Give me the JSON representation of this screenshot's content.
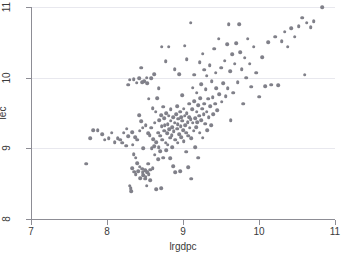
{
  "chart_data": {
    "type": "scatter",
    "title": "",
    "xlabel": "lrgdpc",
    "ylabel": "lec",
    "xlim": [
      7,
      11
    ],
    "ylim": [
      8,
      11
    ],
    "xticks": [
      7,
      8,
      9,
      10,
      11
    ],
    "yticks": [
      8,
      9,
      10,
      11
    ],
    "xticklabels": [
      "7",
      "8",
      "9",
      "10",
      "11"
    ],
    "yticklabels": [
      "8",
      "9",
      "10",
      "11"
    ],
    "grid": "horizontal",
    "legend": "none",
    "marker_color": "#808089",
    "marker_size": 3.6,
    "n_points": 243,
    "points": [
      [
        7.73,
        8.78
      ],
      [
        7.78,
        9.14
      ],
      [
        7.82,
        9.26
      ],
      [
        7.88,
        9.26
      ],
      [
        7.94,
        9.2
      ],
      [
        7.97,
        9.12
      ],
      [
        8.02,
        9.14
      ],
      [
        8.06,
        9.22
      ],
      [
        8.1,
        9.09
      ],
      [
        8.14,
        9.14
      ],
      [
        8.17,
        9.12
      ],
      [
        8.2,
        9.08
      ],
      [
        8.22,
        9.22
      ],
      [
        8.25,
        9.04
      ],
      [
        8.26,
        9.28
      ],
      [
        8.28,
        9.17
      ],
      [
        8.28,
        9.9
      ],
      [
        8.3,
        9.97
      ],
      [
        8.3,
        8.47
      ],
      [
        8.31,
        8.44
      ],
      [
        8.32,
        8.39
      ],
      [
        8.33,
        9.23
      ],
      [
        8.33,
        8.72
      ],
      [
        8.34,
        9.05
      ],
      [
        8.35,
        8.92
      ],
      [
        8.35,
        9.98
      ],
      [
        8.36,
        8.67
      ],
      [
        8.37,
        9.16
      ],
      [
        8.38,
        8.87
      ],
      [
        8.38,
        8.63
      ],
      [
        8.39,
        9.93
      ],
      [
        8.4,
        9.12
      ],
      [
        8.4,
        8.79
      ],
      [
        8.41,
        8.68
      ],
      [
        8.42,
        9.47
      ],
      [
        8.42,
        9.99
      ],
      [
        8.43,
        9.25
      ],
      [
        8.43,
        8.74
      ],
      [
        8.44,
        8.58
      ],
      [
        8.45,
        10.14
      ],
      [
        8.45,
        9.38
      ],
      [
        8.46,
        9.94
      ],
      [
        8.46,
        8.71
      ],
      [
        8.47,
        9.29
      ],
      [
        8.47,
        8.66
      ],
      [
        8.48,
        8.62
      ],
      [
        8.48,
        9.0
      ],
      [
        8.49,
        9.95
      ],
      [
        8.5,
        8.69
      ],
      [
        8.5,
        8.57
      ],
      [
        8.51,
        8.6
      ],
      [
        8.51,
        9.33
      ],
      [
        8.52,
        10.0
      ],
      [
        8.52,
        8.47
      ],
      [
        8.53,
        9.92
      ],
      [
        8.53,
        8.66
      ],
      [
        8.54,
        9.21
      ],
      [
        8.54,
        8.78
      ],
      [
        8.55,
        9.7
      ],
      [
        8.55,
        8.63
      ],
      [
        8.56,
        9.19
      ],
      [
        8.57,
        8.55
      ],
      [
        8.57,
        8.7
      ],
      [
        8.58,
        9.99
      ],
      [
        8.58,
        9.29
      ],
      [
        8.59,
        9.0
      ],
      [
        8.6,
        9.57
      ],
      [
        8.6,
        8.72
      ],
      [
        8.61,
        9.13
      ],
      [
        8.62,
        9.03
      ],
      [
        8.62,
        10.05
      ],
      [
        8.63,
        9.36
      ],
      [
        8.63,
        8.91
      ],
      [
        8.64,
        9.52
      ],
      [
        8.65,
        9.09
      ],
      [
        8.65,
        8.42
      ],
      [
        8.66,
        9.71
      ],
      [
        8.67,
        9.22
      ],
      [
        8.67,
        8.85
      ],
      [
        8.68,
        9.02
      ],
      [
        8.68,
        9.85
      ],
      [
        8.69,
        9.4
      ],
      [
        8.7,
        9.18
      ],
      [
        8.7,
        8.96
      ],
      [
        8.71,
        9.47
      ],
      [
        8.71,
        8.44
      ],
      [
        8.72,
        9.31
      ],
      [
        8.72,
        10.44
      ],
      [
        8.73,
        9.12
      ],
      [
        8.74,
        9.59
      ],
      [
        8.74,
        8.87
      ],
      [
        8.75,
        9.43
      ],
      [
        8.75,
        9.25
      ],
      [
        8.76,
        9.33
      ],
      [
        8.77,
        9.08
      ],
      [
        8.77,
        10.23
      ],
      [
        8.78,
        9.5
      ],
      [
        8.78,
        8.97
      ],
      [
        8.79,
        9.21
      ],
      [
        8.8,
        9.34
      ],
      [
        8.8,
        9.05
      ],
      [
        8.81,
        9.46
      ],
      [
        8.81,
        10.44
      ],
      [
        8.82,
        9.27
      ],
      [
        8.83,
        9.15
      ],
      [
        8.83,
        8.86
      ],
      [
        8.84,
        9.39
      ],
      [
        8.84,
        9.55
      ],
      [
        8.85,
        9.19
      ],
      [
        8.86,
        9.3
      ],
      [
        8.86,
        9.02
      ],
      [
        8.87,
        9.44
      ],
      [
        8.87,
        8.75
      ],
      [
        8.88,
        9.24
      ],
      [
        8.89,
        9.36
      ],
      [
        8.89,
        10.12
      ],
      [
        8.9,
        9.12
      ],
      [
        8.9,
        8.66
      ],
      [
        8.91,
        9.48
      ],
      [
        8.92,
        9.28
      ],
      [
        8.92,
        9.6
      ],
      [
        8.93,
        9.34
      ],
      [
        8.93,
        9.08
      ],
      [
        8.94,
        9.42
      ],
      [
        8.95,
        9.2
      ],
      [
        8.95,
        10.05
      ],
      [
        8.96,
        9.52
      ],
      [
        8.96,
        8.68
      ],
      [
        8.97,
        9.31
      ],
      [
        8.98,
        9.44
      ],
      [
        8.98,
        9.16
      ],
      [
        8.99,
        9.39
      ],
      [
        8.99,
        9.75
      ],
      [
        9.0,
        9.26
      ],
      [
        9.01,
        9.56
      ],
      [
        9.01,
        9.1
      ],
      [
        9.02,
        9.46
      ],
      [
        9.02,
        10.45
      ],
      [
        9.03,
        9.33
      ],
      [
        9.04,
        9.22
      ],
      [
        9.04,
        8.95
      ],
      [
        9.05,
        9.5
      ],
      [
        9.05,
        10.26
      ],
      [
        9.06,
        9.37
      ],
      [
        9.07,
        9.18
      ],
      [
        9.07,
        8.73
      ],
      [
        9.08,
        9.44
      ],
      [
        9.08,
        9.63
      ],
      [
        9.09,
        9.29
      ],
      [
        9.1,
        9.41
      ],
      [
        9.1,
        10.78
      ],
      [
        9.11,
        9.14
      ],
      [
        9.11,
        8.57
      ],
      [
        9.12,
        9.55
      ],
      [
        9.13,
        9.36
      ],
      [
        9.13,
        9.86
      ],
      [
        9.14,
        9.25
      ],
      [
        9.15,
        9.67
      ],
      [
        9.15,
        10.04
      ],
      [
        9.16,
        9.43
      ],
      [
        9.16,
        9.02
      ],
      [
        9.17,
        9.3
      ],
      [
        9.18,
        9.52
      ],
      [
        9.18,
        9.79
      ],
      [
        9.19,
        9.37
      ],
      [
        9.2,
        9.61
      ],
      [
        9.2,
        8.87
      ],
      [
        9.21,
        9.46
      ],
      [
        9.22,
        9.22
      ],
      [
        9.22,
        10.22
      ],
      [
        9.23,
        9.71
      ],
      [
        9.24,
        9.4
      ],
      [
        9.24,
        9.91
      ],
      [
        9.25,
        9.56
      ],
      [
        9.26,
        10.34
      ],
      [
        9.26,
        9.15
      ],
      [
        9.27,
        9.48
      ],
      [
        9.28,
        9.63
      ],
      [
        9.28,
        10.11
      ],
      [
        9.29,
        9.35
      ],
      [
        9.3,
        9.84
      ],
      [
        9.31,
        9.52
      ],
      [
        9.31,
        10.03
      ],
      [
        9.32,
        9.26
      ],
      [
        9.33,
        9.7
      ],
      [
        9.34,
        9.44
      ],
      [
        9.35,
        10.18
      ],
      [
        9.36,
        9.6
      ],
      [
        9.37,
        9.33
      ],
      [
        9.38,
        9.95
      ],
      [
        9.39,
        9.72
      ],
      [
        9.4,
        9.48
      ],
      [
        9.41,
        10.41
      ],
      [
        9.42,
        9.63
      ],
      [
        9.43,
        10.07
      ],
      [
        9.44,
        9.85
      ],
      [
        9.45,
        9.54
      ],
      [
        9.47,
        10.55
      ],
      [
        9.48,
        9.77
      ],
      [
        9.5,
        10.14
      ],
      [
        9.51,
        9.66
      ],
      [
        9.53,
        9.92
      ],
      [
        9.55,
        10.24
      ],
      [
        9.56,
        9.74
      ],
      [
        9.58,
        10.47
      ],
      [
        9.59,
        9.85
      ],
      [
        9.6,
        10.76
      ],
      [
        9.62,
        10.09
      ],
      [
        9.63,
        9.4
      ],
      [
        9.65,
        10.33
      ],
      [
        9.66,
        9.79
      ],
      [
        9.68,
        10.2
      ],
      [
        9.7,
        10.49
      ],
      [
        9.72,
        9.94
      ],
      [
        9.74,
        10.76
      ],
      [
        9.75,
        10.36
      ],
      [
        9.77,
        10.12
      ],
      [
        9.79,
        9.63
      ],
      [
        9.81,
        10.28
      ],
      [
        9.83,
        10.0
      ],
      [
        9.85,
        10.55
      ],
      [
        9.88,
        10.2
      ],
      [
        9.9,
        9.87
      ],
      [
        9.93,
        10.44
      ],
      [
        9.96,
        10.07
      ],
      [
        10.0,
        9.73
      ],
      [
        10.04,
        10.29
      ],
      [
        10.08,
        9.88
      ],
      [
        10.12,
        10.5
      ],
      [
        10.16,
        9.9
      ],
      [
        10.21,
        10.58
      ],
      [
        10.25,
        9.89
      ],
      [
        10.3,
        10.52
      ],
      [
        10.34,
        10.65
      ],
      [
        10.38,
        10.44
      ],
      [
        10.42,
        10.7
      ],
      [
        10.47,
        10.58
      ],
      [
        10.52,
        10.73
      ],
      [
        10.57,
        10.85
      ],
      [
        10.6,
        10.04
      ],
      [
        10.63,
        10.78
      ],
      [
        10.68,
        10.71
      ],
      [
        10.72,
        10.8
      ],
      [
        10.83,
        11.0
      ]
    ]
  }
}
